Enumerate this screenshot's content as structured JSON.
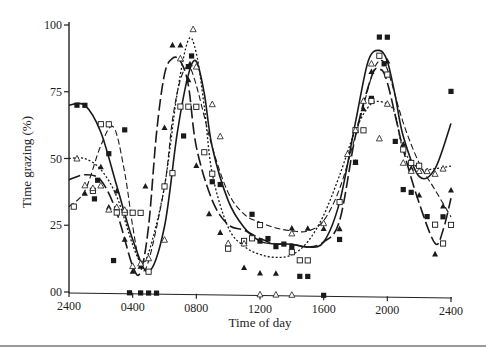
{
  "chart_data": {
    "type": "scatter",
    "title": "",
    "xlabel": "Time of day",
    "ylabel": "Time grazing (%)",
    "xlim": [
      0,
      24
    ],
    "ylim": [
      0,
      100
    ],
    "x_ticks": [
      {
        "value": 0,
        "label": "2400"
      },
      {
        "value": 4,
        "label": "0400"
      },
      {
        "value": 8,
        "label": "0800"
      },
      {
        "value": 12,
        "label": "1200"
      },
      {
        "value": 16,
        "label": "1600"
      },
      {
        "value": 20,
        "label": "2000"
      },
      {
        "value": 24,
        "label": "2400"
      }
    ],
    "y_ticks": [
      {
        "value": 0,
        "label": "00"
      },
      {
        "value": 25,
        "label": "25"
      },
      {
        "value": 50,
        "label": "50"
      },
      {
        "value": 75,
        "label": "75"
      },
      {
        "value": 100,
        "label": "100"
      }
    ],
    "grid": false,
    "legend": null,
    "series": [
      {
        "name": "filled squares",
        "marker": "square-filled",
        "line": "solid",
        "points": [
          [
            0.5,
            70
          ],
          [
            1,
            70
          ],
          [
            3.5,
            61
          ],
          [
            2.5,
            52
          ],
          [
            1.8,
            42
          ],
          [
            1.6,
            35
          ],
          [
            3.8,
            0
          ],
          [
            4.5,
            0
          ],
          [
            5,
            0
          ],
          [
            5.5,
            0
          ],
          [
            2.8,
            12
          ],
          [
            7.2,
            59
          ],
          [
            7.5,
            85
          ],
          [
            7.7,
            89
          ],
          [
            8,
            70
          ],
          [
            9,
            42
          ],
          [
            9.5,
            41
          ],
          [
            11,
            20
          ],
          [
            11.5,
            30
          ],
          [
            12,
            20
          ],
          [
            12.5,
            21
          ],
          [
            13,
            18
          ],
          [
            13.5,
            19
          ],
          [
            14,
            18
          ],
          [
            14.5,
            7
          ],
          [
            15,
            7
          ],
          [
            16,
            0
          ],
          [
            17,
            21
          ],
          [
            18,
            50
          ],
          [
            19,
            74
          ],
          [
            19.5,
            97
          ],
          [
            20,
            97
          ],
          [
            19.8,
            87
          ],
          [
            20.5,
            58
          ],
          [
            21,
            40
          ],
          [
            21.5,
            39
          ],
          [
            22.5,
            30
          ],
          [
            23.5,
            30
          ],
          [
            24,
            77
          ]
        ],
        "curve": [
          [
            0,
            70
          ],
          [
            1,
            70
          ],
          [
            2,
            60
          ],
          [
            3,
            40
          ],
          [
            4,
            20
          ],
          [
            5,
            8
          ],
          [
            6,
            25
          ],
          [
            6.8,
            60
          ],
          [
            7.5,
            82
          ],
          [
            8,
            87
          ],
          [
            8.5,
            75
          ],
          [
            9,
            55
          ],
          [
            10,
            35
          ],
          [
            11,
            25
          ],
          [
            12,
            20
          ],
          [
            13,
            19
          ],
          [
            14,
            19
          ],
          [
            15,
            18
          ],
          [
            16,
            20
          ],
          [
            17,
            35
          ],
          [
            18,
            65
          ],
          [
            18.8,
            88
          ],
          [
            19.5,
            92
          ],
          [
            20,
            88
          ],
          [
            20.5,
            75
          ],
          [
            21,
            60
          ],
          [
            22,
            45
          ],
          [
            23,
            48
          ],
          [
            24,
            65
          ]
        ]
      },
      {
        "name": "filled triangles",
        "marker": "triangle-filled",
        "line": "long-dash",
        "points": [
          [
            1,
            37
          ],
          [
            2,
            47
          ],
          [
            3,
            38
          ],
          [
            2.5,
            32
          ],
          [
            3.5,
            20
          ],
          [
            4,
            8
          ],
          [
            4.5,
            10
          ],
          [
            4.8,
            40
          ],
          [
            6,
            62
          ],
          [
            6.5,
            93
          ],
          [
            7,
            93
          ],
          [
            7.6,
            86
          ],
          [
            7.5,
            80
          ],
          [
            8,
            48
          ],
          [
            8.8,
            30
          ],
          [
            9.5,
            23
          ],
          [
            11,
            10
          ],
          [
            12,
            8
          ],
          [
            13,
            8
          ],
          [
            14,
            25
          ],
          [
            15,
            25
          ],
          [
            16,
            25
          ],
          [
            17,
            25
          ],
          [
            18,
            50
          ],
          [
            18.5,
            70
          ],
          [
            19,
            84
          ],
          [
            20,
            88
          ],
          [
            21,
            57
          ],
          [
            21.5,
            48
          ],
          [
            22,
            38
          ],
          [
            23,
            16
          ],
          [
            23.5,
            34
          ],
          [
            24,
            40
          ]
        ],
        "curve": [
          [
            0,
            42
          ],
          [
            1,
            44
          ],
          [
            2,
            42
          ],
          [
            3,
            30
          ],
          [
            4,
            10
          ],
          [
            4.5,
            8
          ],
          [
            5,
            25
          ],
          [
            5.5,
            60
          ],
          [
            6,
            82
          ],
          [
            6.5,
            88
          ],
          [
            7,
            87
          ],
          [
            7.5,
            78
          ],
          [
            8,
            55
          ],
          [
            9,
            35
          ],
          [
            10,
            26
          ],
          [
            11,
            24
          ],
          [
            12,
            21
          ],
          [
            13,
            19
          ],
          [
            14,
            19
          ],
          [
            15,
            18
          ],
          [
            16,
            20
          ],
          [
            17,
            28
          ],
          [
            18,
            60
          ],
          [
            19,
            82
          ],
          [
            19.5,
            85
          ],
          [
            20,
            80
          ],
          [
            21,
            55
          ],
          [
            22,
            35
          ],
          [
            23,
            20
          ],
          [
            23.5,
            25
          ],
          [
            24,
            37
          ]
        ]
      },
      {
        "name": "open squares",
        "marker": "square-open",
        "line": "dash",
        "points": [
          [
            0.3,
            32
          ],
          [
            1.5,
            38
          ],
          [
            2,
            63
          ],
          [
            2.5,
            63
          ],
          [
            3,
            30
          ],
          [
            3.5,
            30
          ],
          [
            4,
            30
          ],
          [
            4.5,
            30
          ],
          [
            5,
            8
          ],
          [
            6,
            40
          ],
          [
            6.5,
            45
          ],
          [
            7,
            70
          ],
          [
            7.5,
            70
          ],
          [
            8,
            70
          ],
          [
            8.5,
            53
          ],
          [
            9,
            45
          ],
          [
            10,
            17
          ],
          [
            11,
            20
          ],
          [
            11.5,
            21
          ],
          [
            12,
            26
          ],
          [
            14,
            16
          ],
          [
            14.5,
            13
          ],
          [
            15,
            13
          ],
          [
            17,
            35
          ],
          [
            18,
            62
          ],
          [
            18.5,
            62
          ],
          [
            19,
            73
          ],
          [
            19.5,
            90
          ],
          [
            20,
            83
          ],
          [
            21,
            55
          ],
          [
            21.5,
            50
          ],
          [
            22,
            49
          ],
          [
            23,
            27
          ],
          [
            23.5,
            20
          ],
          [
            24,
            27
          ]
        ],
        "curve": [
          [
            0,
            32
          ],
          [
            1,
            38
          ],
          [
            2,
            55
          ],
          [
            2.8,
            62
          ],
          [
            3.5,
            45
          ],
          [
            4,
            25
          ],
          [
            4.5,
            10
          ],
          [
            5,
            12
          ],
          [
            6,
            40
          ],
          [
            6.5,
            65
          ],
          [
            7,
            80
          ],
          [
            7.5,
            85
          ],
          [
            8,
            78
          ],
          [
            9,
            55
          ],
          [
            10,
            38
          ],
          [
            11,
            30
          ],
          [
            12,
            27
          ],
          [
            13,
            25
          ],
          [
            14,
            24
          ],
          [
            15,
            24
          ],
          [
            16,
            28
          ],
          [
            17,
            40
          ],
          [
            18,
            60
          ],
          [
            19,
            82
          ],
          [
            19.5,
            88
          ],
          [
            20,
            85
          ],
          [
            21,
            65
          ],
          [
            22,
            50
          ],
          [
            23,
            40
          ],
          [
            24,
            30
          ]
        ]
      },
      {
        "name": "open triangles",
        "marker": "triangle-open",
        "line": "dotted",
        "points": [
          [
            0.5,
            50
          ],
          [
            1,
            40
          ],
          [
            1.5,
            39
          ],
          [
            2,
            40
          ],
          [
            2.5,
            31
          ],
          [
            3,
            32
          ],
          [
            3.5,
            31
          ],
          [
            4,
            10
          ],
          [
            4.5,
            11
          ],
          [
            5,
            13
          ],
          [
            6,
            20
          ],
          [
            7,
            88
          ],
          [
            7.8,
            99
          ],
          [
            8,
            85
          ],
          [
            9,
            71
          ],
          [
            9.5,
            59
          ],
          [
            10,
            19
          ],
          [
            11,
            19
          ],
          [
            12,
            0
          ],
          [
            13,
            0
          ],
          [
            14,
            0
          ],
          [
            14,
            23
          ],
          [
            16,
            27
          ],
          [
            17.5,
            53
          ],
          [
            18,
            62
          ],
          [
            18.5,
            73
          ],
          [
            19,
            87
          ],
          [
            19.5,
            59
          ],
          [
            20,
            72
          ],
          [
            21,
            50
          ],
          [
            21.5,
            47
          ],
          [
            22,
            47
          ],
          [
            22.5,
            47
          ],
          [
            23,
            46
          ],
          [
            23.5,
            48
          ]
        ],
        "curve": [
          [
            0,
            50
          ],
          [
            1,
            50
          ],
          [
            2,
            46
          ],
          [
            3,
            36
          ],
          [
            4,
            18
          ],
          [
            4.5,
            12
          ],
          [
            5,
            15
          ],
          [
            6,
            40
          ],
          [
            6.8,
            75
          ],
          [
            7.5,
            95
          ],
          [
            8,
            90
          ],
          [
            8.5,
            70
          ],
          [
            9,
            45
          ],
          [
            10,
            25
          ],
          [
            11,
            18
          ],
          [
            12,
            15
          ],
          [
            13,
            14
          ],
          [
            14,
            15
          ],
          [
            15,
            20
          ],
          [
            16,
            30
          ],
          [
            17,
            45
          ],
          [
            18,
            62
          ],
          [
            19,
            72
          ],
          [
            20,
            72
          ],
          [
            20.5,
            68
          ],
          [
            21,
            55
          ],
          [
            22,
            48
          ],
          [
            23,
            48
          ],
          [
            24,
            49
          ]
        ]
      }
    ]
  }
}
